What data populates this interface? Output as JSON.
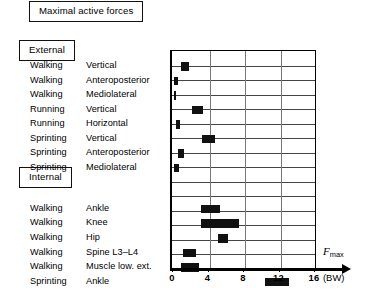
{
  "title": {
    "text": "Maximal active forces"
  },
  "sections": [
    {
      "id": "external",
      "heading": "External"
    },
    {
      "id": "internal",
      "heading": "Internal"
    }
  ],
  "rows": [
    {
      "activity": "Walking",
      "measure": "Vertical",
      "group": "External"
    },
    {
      "activity": "Walking",
      "measure": "Anteroposterior",
      "group": "External"
    },
    {
      "activity": "Walking",
      "measure": "Mediolateral",
      "group": "External"
    },
    {
      "activity": "Running",
      "measure": "Vertical",
      "group": "External"
    },
    {
      "activity": "Running",
      "measure": "Horizontal",
      "group": "External"
    },
    {
      "activity": "Sprinting",
      "measure": "Vertical",
      "group": "External"
    },
    {
      "activity": "Sprinting",
      "measure": "Anteroposterior",
      "group": "External"
    },
    {
      "activity": "Sprinting",
      "measure": "Mediolateral",
      "group": "External"
    },
    {
      "activity": "Walking",
      "measure": "Ankle",
      "group": "Internal"
    },
    {
      "activity": "Walking",
      "measure": "Knee",
      "group": "Internal"
    },
    {
      "activity": "Walking",
      "measure": "Hip",
      "group": "Internal"
    },
    {
      "activity": "Walking",
      "measure": "Spine L3–L4",
      "group": "Internal"
    },
    {
      "activity": "Walking",
      "measure": "Muscle low. ext.",
      "group": "Internal"
    },
    {
      "activity": "Sprinting",
      "measure": "Ankle",
      "group": "Internal"
    }
  ],
  "axis": {
    "label": "F",
    "label_sub": "max",
    "unit": "(BW)",
    "ticks": [
      0,
      4,
      8,
      12,
      16
    ],
    "min": 0,
    "max": 16
  },
  "chart_data": {
    "type": "bar",
    "orientation": "horizontal",
    "title": "Maximal active forces",
    "xlabel": "Fmax (BW)",
    "ylabel": "",
    "xlim": [
      0,
      16
    ],
    "grid": true,
    "legend": false,
    "categories": [
      "Walking Vertical",
      "Walking Anteroposterior",
      "Walking Mediolateral",
      "Running Vertical",
      "Running Horizontal",
      "Sprinting Vertical",
      "Sprinting Anteroposterior",
      "Sprinting Mediolateral",
      "Walking Ankle",
      "Walking Knee",
      "Walking Hip",
      "Walking Spine L3–L4",
      "Walking Muscle low. ext.",
      "Sprinting Ankle"
    ],
    "ranges": [
      [
        0.8,
        1.7
      ],
      [
        0.0,
        0.4
      ],
      [
        0.0,
        0.2
      ],
      [
        2.0,
        3.3
      ],
      [
        0.2,
        0.7
      ],
      [
        3.2,
        4.6
      ],
      [
        0.4,
        1.1
      ],
      [
        0.0,
        0.6
      ],
      [
        3.0,
        5.2
      ],
      [
        3.0,
        7.3
      ],
      [
        5.0,
        6.1
      ],
      [
        1.0,
        2.5
      ],
      [
        0.8,
        2.8
      ],
      [
        10.2,
        13.0
      ]
    ],
    "units": "BW (body weight)"
  }
}
